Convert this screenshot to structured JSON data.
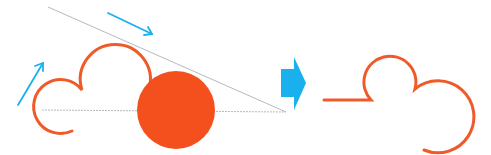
{
  "diagram": {
    "colors": {
      "curve": "#f05a28",
      "disc": "#f4501e",
      "arrow": "#1ab0ee",
      "guide_line": "#b8b8c0"
    },
    "left_figure": {
      "guide_lines": [
        {
          "from": [
            48,
            7
          ],
          "to": [
            286,
            112
          ],
          "style": "solid"
        },
        {
          "from": [
            42,
            110
          ],
          "to": [
            286,
            112
          ],
          "style": "dotted"
        }
      ],
      "motion_arrows": [
        {
          "from": [
            18,
            105
          ],
          "to": [
            43,
            63
          ]
        },
        {
          "from": [
            108,
            13
          ],
          "to": [
            152,
            34
          ]
        }
      ],
      "disc": {
        "cx": 176,
        "cy": 110,
        "r": 39
      }
    },
    "transform_arrow": {
      "direction": "right"
    },
    "right_figure": {
      "segments": [
        "horizontal line",
        "small arc",
        "large arc"
      ]
    }
  }
}
